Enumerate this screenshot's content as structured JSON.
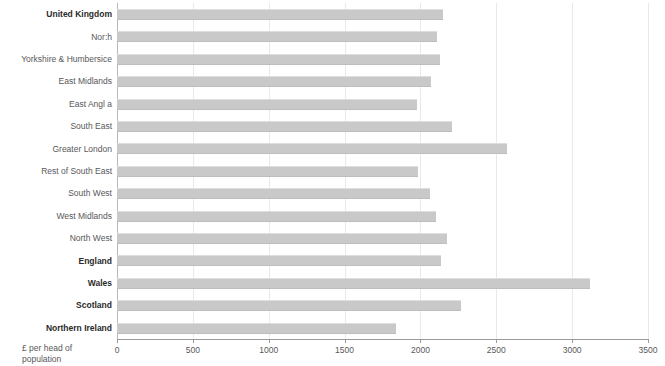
{
  "chart_data": {
    "type": "bar",
    "orientation": "horizontal",
    "title": "",
    "subtitle": "",
    "xlabel": "£ per head of population",
    "ylabel": "",
    "xlim": [
      0,
      3500
    ],
    "xticks": [
      0,
      500,
      1000,
      1500,
      2000,
      2500,
      3000,
      3500
    ],
    "xtick_labels": [
      "0",
      "500",
      "1000",
      "1500",
      "2000",
      "2500",
      "3000",
      "3500"
    ],
    "grid": true,
    "grid_axis": "x",
    "legend": null,
    "bar_color": "#c9c9c9",
    "categories": [
      "United Kingdom",
      "Nor:h",
      "Yorkshire & Humbersice",
      "East Midlands",
      "East Angl a",
      "South East",
      "Greater London",
      "Rest of South East",
      "South West",
      "West Midlands",
      "North West",
      "England",
      "Wales",
      "Scotland",
      "Northern Ireland"
    ],
    "emphasis": [
      true,
      false,
      false,
      false,
      false,
      false,
      false,
      false,
      false,
      false,
      false,
      true,
      true,
      true,
      true
    ],
    "values": [
      2150,
      2110,
      2130,
      2070,
      1975,
      2210,
      2570,
      1985,
      2060,
      2100,
      2175,
      2135,
      3120,
      2270,
      1840
    ]
  },
  "axis_title": {
    "line1": "£ per head of",
    "line2": "population"
  }
}
